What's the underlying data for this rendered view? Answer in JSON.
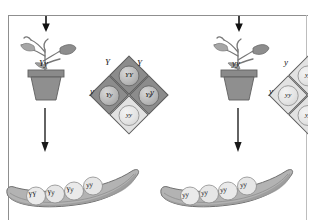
{
  "figure": {
    "background_color": "#ffffff",
    "line_color": "#8f8f8f"
  },
  "panels": [
    {
      "id": "left",
      "parent_plant": {
        "genotype_label": "Yy",
        "pot_color": "#8a8a8a",
        "description": "pea plant in pot"
      },
      "top_arrow": "down-arrow",
      "middle_arrow": "down-arrow",
      "punnett": {
        "top_alleles": [
          "Y",
          "Y"
        ],
        "side_allele": "y",
        "right_allele": "y",
        "cells": [
          {
            "position": "top",
            "genotype": "YY",
            "phenotype": "dominant",
            "fill": "#8c8c8c"
          },
          {
            "position": "left",
            "genotype": "Yy",
            "phenotype": "dominant",
            "fill": "#8c8c8c"
          },
          {
            "position": "right",
            "genotype": "Yy",
            "phenotype": "dominant",
            "fill": "#8c8c8c"
          },
          {
            "position": "bottom",
            "genotype": "yy",
            "phenotype": "recessive",
            "fill": "#e2e2e2"
          }
        ]
      },
      "pod": {
        "peas": [
          "YY",
          "Yy",
          "Yy",
          "yy"
        ],
        "description": "pea pod with four seeds"
      }
    },
    {
      "id": "right",
      "parent_plant": {
        "genotype_label": "yy",
        "pot_color": "#8a8a8a",
        "description": "pea plant in pot"
      },
      "top_arrow": "down-arrow",
      "middle_arrow": "down-arrow",
      "punnett": {
        "top_alleles": [
          "y",
          "y"
        ],
        "side_allele": "y",
        "right_allele": "y",
        "cells": [
          {
            "position": "top",
            "genotype": "yy",
            "phenotype": "recessive",
            "fill": "#e2e2e2"
          },
          {
            "position": "left",
            "genotype": "yy",
            "phenotype": "recessive",
            "fill": "#d6d6d6"
          },
          {
            "position": "right",
            "genotype": "yy",
            "phenotype": "recessive",
            "fill": "#e2e2e2"
          },
          {
            "position": "bottom",
            "genotype": "yy",
            "phenotype": "recessive",
            "fill": "#e2e2e2"
          }
        ]
      },
      "pod": {
        "peas": [
          "yy",
          "yy",
          "yy",
          "yy"
        ],
        "description": "pea pod with four seeds"
      }
    }
  ]
}
